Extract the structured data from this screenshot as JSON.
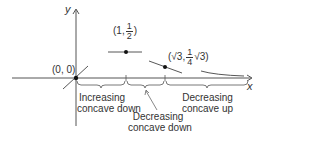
{
  "axes": {
    "x_label": "x",
    "y_label": "y"
  },
  "points": {
    "origin": "(0, 0)",
    "max_point": {
      "open": "(1,",
      "num": "1",
      "den": "2",
      "close": ")"
    },
    "inflection_point": {
      "open": "(√3,",
      "num": "1",
      "den": "4",
      "close": "√3)"
    }
  },
  "intervals": {
    "first_line1": "Increasing",
    "first_line2": "concave down",
    "second_line1": "Decreasing",
    "second_line2": "concave down",
    "third_line1": "Decreasing",
    "third_line2": "concave up"
  },
  "colors": {
    "stroke": "#333333",
    "background": "#ffffff"
  }
}
